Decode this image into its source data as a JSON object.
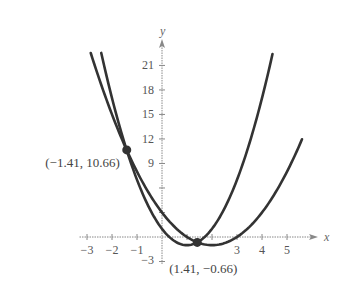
{
  "chart_data": {
    "type": "line",
    "title": "",
    "xlabel": "x",
    "ylabel": "y",
    "xlim": [
      -3.3,
      6
    ],
    "ylim": [
      -3,
      23
    ],
    "grid": false,
    "x_ticks": [
      -3,
      -2,
      -1,
      3,
      4,
      5
    ],
    "x_tick_labels": [
      "−3",
      "−2",
      "−1",
      "3",
      "4",
      "5"
    ],
    "y_ticks": [
      21,
      18,
      15,
      12,
      9
    ],
    "y_tick_labels": [
      "21",
      "18",
      "15",
      "12",
      "9"
    ],
    "y_unlabeled_ticks": [
      6,
      3
    ],
    "y_neg_tick_label": "−3",
    "series": [
      {
        "name": "y = x² − 4x + 3",
        "coeffs": [
          1,
          -4,
          3
        ],
        "x_range": [
          -2.85,
          5.6
        ]
      },
      {
        "name": "y = 2x² − 4x + 1",
        "coeffs": [
          2,
          -4,
          1
        ],
        "x_range": [
          -2.43,
          4.42
        ]
      }
    ],
    "points": [
      {
        "x": -1.41,
        "y": 10.66,
        "label": "(−1.41, 10.66)"
      },
      {
        "x": 1.41,
        "y": -0.66,
        "label": "(1.41, −0.66)"
      }
    ],
    "line_color": "#333333",
    "axis_color": "#888888"
  }
}
